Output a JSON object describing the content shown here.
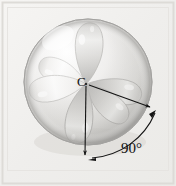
{
  "figure": {
    "kind": "orbital-diagram",
    "background_color": "#f2f1ef",
    "border_color": "#d8d6d2",
    "ink_color": "#141414"
  },
  "labels": {
    "center_atom": "C",
    "bond_angle": "90°"
  },
  "sphere": {
    "center_x": 88,
    "center_y": 82,
    "radius_x": 64,
    "radius_y": 63,
    "fill_light": "#fbfbfa",
    "fill_dark": "#bdbcba",
    "edge_color": "#a9a8a5"
  },
  "lobes": [
    {
      "name": "lobe-top",
      "angle_deg": -90,
      "length": 60,
      "width": 27,
      "tone": "dark"
    },
    {
      "name": "lobe-upper-left",
      "angle_deg": -160,
      "length": 50,
      "width": 23,
      "tone": "light"
    },
    {
      "name": "lobe-lower-left",
      "angle_deg": 168,
      "length": 55,
      "width": 25,
      "tone": "light"
    },
    {
      "name": "lobe-bottom",
      "angle_deg": 96,
      "length": 58,
      "width": 26,
      "tone": "dark"
    },
    {
      "name": "lobe-lower-right",
      "angle_deg": 38,
      "length": 52,
      "width": 25,
      "tone": "dark"
    },
    {
      "name": "lobe-right",
      "angle_deg": 8,
      "length": 55,
      "width": 24,
      "tone": "dark"
    }
  ],
  "annotation": {
    "vertex_x": 86,
    "vertex_y": 84,
    "ray_down": {
      "to_x": 85,
      "to_y": 158,
      "arrowhead": true
    },
    "ray_diagonal": {
      "to_x": 152,
      "to_y": 108,
      "arrowhead": true
    },
    "arc": {
      "radius": 74,
      "start_deg": 90,
      "end_deg": 20
    },
    "value_text": "90°"
  }
}
